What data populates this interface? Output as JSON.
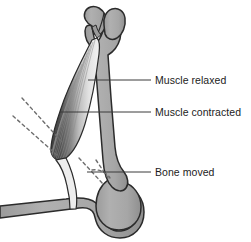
{
  "diagram": {
    "background_color": "#ffffff",
    "labels": [
      {
        "id": "muscle-relaxed",
        "text": "Muscle relaxed",
        "x": 155,
        "y": 75,
        "leader": {
          "x1": 88,
          "y1": 80,
          "x2": 151,
          "y2": 80
        }
      },
      {
        "id": "muscle-contracted",
        "text": "Muscle contracted",
        "x": 155,
        "y": 107,
        "leader": {
          "x1": 60,
          "y1": 112,
          "x2": 151,
          "y2": 112
        }
      },
      {
        "id": "bone-moved",
        "text": "Bone moved",
        "x": 155,
        "y": 167,
        "leader": {
          "x1": 87,
          "y1": 172,
          "x2": 151,
          "y2": 172
        }
      }
    ],
    "colors": {
      "bone_fill": "#a9a9a9",
      "bone_outline": "#2b2b2b",
      "bone_highlight": "#c9c9c9",
      "muscle_dark": "#4a4a4a",
      "muscle_mid": "#9a9a9a",
      "muscle_light": "#ededed",
      "striation": "#8d8d8d",
      "leader_line": "#3a3a3a",
      "dashed_line": "#6e6e6e",
      "text": "#1c1c1c"
    },
    "parts": {
      "upper_bone": "vertical long bone shaft with two rounded condyle lobes at top",
      "lower_bone": "horizontal bone with rounded joint head forming the hinge",
      "muscle": "triangular muscle belly, dark contracted fibers on left fading to light relaxed fibers on right, tapering to a tendon at the lower joint",
      "motion_guides": "two diagonal dashed lines to the upper left and a dashed arc near the joint showing range of movement"
    }
  }
}
